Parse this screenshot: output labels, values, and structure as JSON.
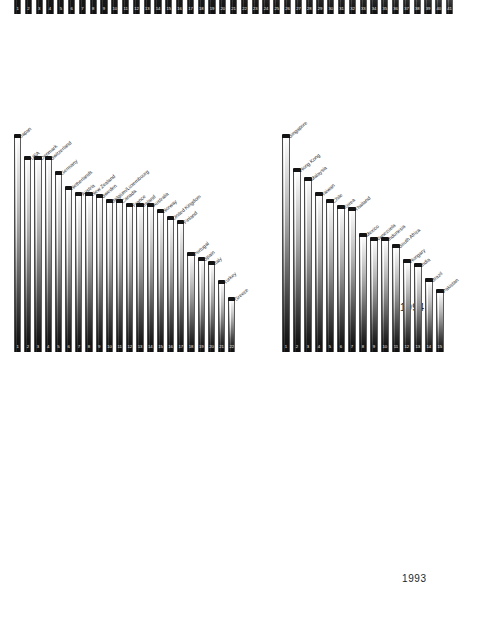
{
  "figure": {
    "background": "#ffffff",
    "bar_fill_top": "#ffffff",
    "bar_fill_bottom": "#101010",
    "bar_cap_color": "#141414",
    "label_color": "#1f1f1f",
    "rank_color": "#f2f2f2"
  },
  "charts": [
    {
      "id": "chart-1994",
      "year_label": "1994",
      "chart_data": {
        "type": "bar",
        "title": "1994",
        "xlabel": "",
        "ylabel": "",
        "grid": false,
        "legend": "none",
        "ylim": [
          0,
          100
        ],
        "categories": [
          "USA",
          "Singapore",
          "Japan",
          "Hong Kong",
          "Germany",
          "Switzerland",
          "Denmark",
          "Netherlands",
          "New Zealand",
          "Sweden",
          "Norway",
          "Austria",
          "France",
          "United Kingdom",
          "Australia",
          "Canada",
          "Malaysia",
          "Taiwan",
          "Ireland",
          "Finland",
          "Belgium/Luxembourg",
          "Chile",
          "Thailand",
          "Korea",
          "Spain",
          "Mexico",
          "Argentina",
          "Portugal",
          "Turkey",
          "Colombia",
          "Indonesia",
          "Italy",
          "Philippines",
          "India",
          "South Africa",
          "Czech Republic",
          "Greece",
          "Brazil",
          "Hungary",
          "Venezuela",
          "Poland"
        ],
        "ranks": [
          "1",
          "2",
          "3",
          "4",
          "5",
          "6",
          "7",
          "8",
          "9",
          "10",
          "11",
          "12",
          "13",
          "14",
          "15",
          "16",
          "17",
          "18",
          "19",
          "20",
          "21",
          "22",
          "23",
          "24",
          "25",
          "26",
          "27",
          "28",
          "29",
          "30",
          "31",
          "32",
          "33",
          "34",
          "35",
          "36",
          "37",
          "38",
          "39",
          "40",
          "41"
        ],
        "values": [
          100,
          96,
          89,
          88,
          84,
          84,
          78,
          75,
          75,
          74,
          72,
          72,
          72,
          67,
          67,
          67,
          67,
          63,
          63,
          62,
          62,
          56,
          55,
          45,
          45,
          44,
          42,
          42,
          41,
          41,
          41,
          39,
          38,
          38,
          33,
          32,
          32,
          29,
          27,
          24,
          22
        ]
      }
    },
    {
      "id": "chart-1993-oecd",
      "year_label": "",
      "chart_data": {
        "type": "bar",
        "title": "",
        "xlabel": "",
        "ylabel": "",
        "grid": false,
        "legend": "none",
        "ylim": [
          0,
          100
        ],
        "categories": [
          "Japan",
          "USA",
          "Denmark",
          "Switzerland",
          "Germany",
          "Netherlands",
          "Austria",
          "New Zealand",
          "Sweden",
          "Belgium/Luxembourg",
          "Canada",
          "France",
          "Ireland",
          "Australia",
          "Norway",
          "United Kingdom",
          "Finland",
          "Portugal",
          "Spain",
          "Italy",
          "Turkey",
          "Greece"
        ],
        "ranks": [
          "1",
          "2",
          "3",
          "4",
          "5",
          "6",
          "7",
          "8",
          "9",
          "10",
          "11",
          "12",
          "13",
          "14",
          "15",
          "16",
          "17",
          "18",
          "19",
          "20",
          "21",
          "22"
        ],
        "values": [
          100,
          90,
          90,
          90,
          83,
          76,
          73,
          73,
          72,
          70,
          70,
          68,
          68,
          68,
          65,
          62,
          60,
          45,
          43,
          41,
          32,
          24
        ]
      }
    },
    {
      "id": "chart-1993-emerging",
      "year_label": "1993",
      "chart_data": {
        "type": "bar",
        "title": "1993",
        "xlabel": "",
        "ylabel": "",
        "grid": false,
        "legend": "none",
        "ylim": [
          0,
          100
        ],
        "categories": [
          "Singapore",
          "Hong Kong",
          "Malaysia",
          "Taiwan",
          "Chile",
          "Korea",
          "Thailand",
          "Mexico",
          "Venezuela",
          "Indonesia",
          "South Africa",
          "Hungary",
          "India",
          "Brazil",
          "Pakistan"
        ],
        "ranks": [
          "1",
          "2",
          "3",
          "4",
          "5",
          "6",
          "7",
          "8",
          "9",
          "10",
          "11",
          "12",
          "13",
          "14",
          "15"
        ],
        "values": [
          100,
          84,
          80,
          73,
          70,
          67,
          66,
          54,
          52,
          52,
          49,
          42,
          40,
          33,
          28
        ]
      }
    }
  ]
}
